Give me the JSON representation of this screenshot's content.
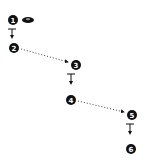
{
  "diagram": {
    "colors": {
      "ink": "#111111",
      "background": "#ffffff"
    },
    "steps": [
      {
        "label": "1",
        "x": 13,
        "y": 20
      },
      {
        "label": "2",
        "x": 14,
        "y": 48
      },
      {
        "label": "3",
        "x": 76,
        "y": 65
      },
      {
        "label": "4",
        "x": 71,
        "y": 100
      },
      {
        "label": "5",
        "x": 132,
        "y": 115
      },
      {
        "label": "6",
        "x": 131,
        "y": 149
      }
    ],
    "eye_icon": {
      "x": 27,
      "y": 20
    },
    "connectors": [
      {
        "type": "solid-t-arrow",
        "from": "1",
        "to": "2"
      },
      {
        "type": "dotted-arrow",
        "from": "2",
        "to": "3"
      },
      {
        "type": "solid-t-arrow",
        "from": "3",
        "to": "4"
      },
      {
        "type": "dotted-arrow",
        "from": "4",
        "to": "5"
      },
      {
        "type": "solid-t-arrow",
        "from": "5",
        "to": "6"
      }
    ]
  }
}
